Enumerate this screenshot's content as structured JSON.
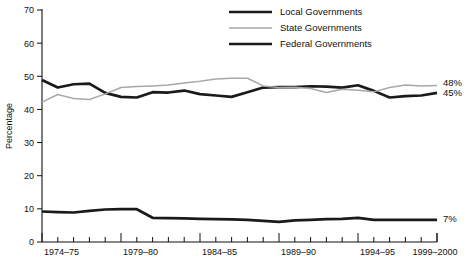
{
  "chart_data": {
    "type": "line",
    "title": "",
    "xlabel": "",
    "ylabel": "Percentage",
    "ylim": [
      0,
      70
    ],
    "ytick_values": [
      0,
      10,
      20,
      30,
      40,
      50,
      60,
      70
    ],
    "ytick_labels": [
      "0",
      "10",
      "20",
      "30",
      "40",
      "50",
      "60",
      "70"
    ],
    "grid": false,
    "legend_position": "top-center",
    "x": [
      "1974–75",
      "1975–76",
      "1976–77",
      "1977–78",
      "1978–79",
      "1979–80",
      "1980–81",
      "1981–82",
      "1982–83",
      "1983–84",
      "1984–85",
      "1985–86",
      "1986–87",
      "1987–88",
      "1988–89",
      "1989–90",
      "1990–91",
      "1991–92",
      "1992–93",
      "1993–94",
      "1994–95",
      "1995–96",
      "1996–97",
      "1997–98",
      "1998–99",
      "1999–2000"
    ],
    "xtick_labels": [
      "1974–75",
      "1979–80",
      "1984–85",
      "1989–90",
      "1994–95",
      "1999–2000"
    ],
    "xtick_label_indices": [
      0,
      5,
      10,
      15,
      20,
      25
    ],
    "series": [
      {
        "name": "Local Governments",
        "color": "#1a1a1a",
        "width": "thick",
        "values": [
          48.9,
          46.6,
          47.6,
          47.8,
          45.0,
          43.8,
          43.6,
          45.2,
          45.1,
          45.7,
          44.6,
          44.2,
          43.8,
          45.2,
          46.6,
          46.7,
          46.7,
          47.0,
          46.9,
          46.6,
          47.3,
          45.6,
          43.6,
          44.0,
          44.2,
          45.0
        ],
        "end_label": "45%"
      },
      {
        "name": "State Governments",
        "color": "#a8a8a8",
        "width": "thin",
        "values": [
          42.2,
          44.5,
          43.3,
          43.0,
          44.7,
          46.6,
          46.9,
          47.1,
          47.4,
          48.0,
          48.5,
          49.2,
          49.4,
          49.4,
          47.1,
          46.6,
          46.7,
          46.3,
          45.1,
          46.1,
          45.8,
          45.3,
          46.6,
          47.4,
          47.1,
          47.2
        ],
        "end_label": "48%"
      },
      {
        "name": "Federal Governments",
        "color": "#1a1a1a",
        "width": "thick",
        "values": [
          9.2,
          9.0,
          8.9,
          9.4,
          9.8,
          9.9,
          9.9,
          7.3,
          7.2,
          7.1,
          7.0,
          6.9,
          6.8,
          6.7,
          6.4,
          6.1,
          6.5,
          6.7,
          6.9,
          7.0,
          7.3,
          6.7,
          6.7,
          6.7,
          6.7,
          6.7
        ],
        "end_label": "7%"
      }
    ],
    "end_labels": [
      {
        "text": "48%",
        "value": 48
      },
      {
        "text": "45%",
        "value": 45
      },
      {
        "text": "7%",
        "value": 7
      }
    ]
  },
  "legend": {
    "items": [
      {
        "label": "Local Governments"
      },
      {
        "label": "State Governments"
      },
      {
        "label": "Federal Governments"
      }
    ]
  },
  "axes": {
    "y_title": "Percentage"
  }
}
